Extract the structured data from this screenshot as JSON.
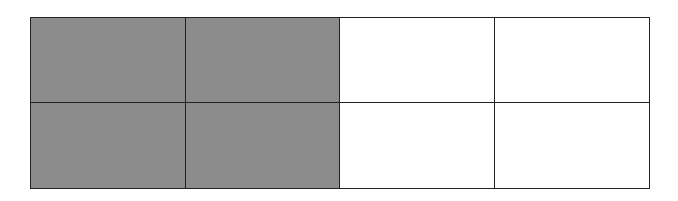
{
  "diagram": {
    "type": "fraction-grid",
    "rows": 2,
    "columns": 4,
    "total_parts": 8,
    "shaded_parts": 4,
    "colors": {
      "shaded": "#8c8c8c",
      "unshaded": "#ffffff",
      "border": "#222222"
    },
    "cells": [
      {
        "row": 1,
        "col": 1,
        "shaded": true
      },
      {
        "row": 1,
        "col": 2,
        "shaded": true
      },
      {
        "row": 1,
        "col": 3,
        "shaded": false
      },
      {
        "row": 1,
        "col": 4,
        "shaded": false
      },
      {
        "row": 2,
        "col": 1,
        "shaded": true
      },
      {
        "row": 2,
        "col": 2,
        "shaded": true
      },
      {
        "row": 2,
        "col": 3,
        "shaded": false
      },
      {
        "row": 2,
        "col": 4,
        "shaded": false
      }
    ]
  }
}
